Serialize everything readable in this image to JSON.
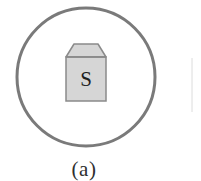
{
  "figure": {
    "caption": "(a)",
    "background_color": "#ffffff",
    "outer_boundary": {
      "name": "enclosing-circle",
      "shape": "circle",
      "center_x": 86,
      "center_y": 77,
      "radius": 69,
      "stroke_color": "#7a7a7a",
      "stroke_width": 3,
      "fill": "none"
    },
    "inner_object": {
      "name": "source-box",
      "label": "S",
      "shape": "rectangle-with-trapezoid-cap",
      "fill_color": "#d6d6d6",
      "stroke_color": "#8a8a8a",
      "stroke_width": 1.5,
      "body": {
        "x": 66,
        "y": 57,
        "width": 40,
        "height": 44
      },
      "cap": {
        "top_left_x": 74,
        "top_right_x": 98,
        "top_y": 44,
        "bottom_left_x": 66,
        "bottom_right_x": 106,
        "bottom_y": 57
      }
    },
    "edge_artifact": {
      "name": "adjacent-figure-edge",
      "x": 192,
      "y_start": 58,
      "y_end": 112,
      "stroke_color": "#dcdcdc",
      "stroke_width": 1
    }
  }
}
